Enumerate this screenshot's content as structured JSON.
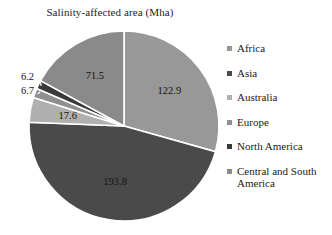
{
  "chart_data": {
    "type": "pie",
    "title": "Salinity-affected area (Mha)",
    "xlabel": "",
    "ylabel": "",
    "legend_position": "right",
    "grid": false,
    "unit": "Mha",
    "total": 418.7,
    "categories": [
      "Africa",
      "Asia",
      "Australia",
      "Europe",
      "North America",
      "Central and South America"
    ],
    "values": [
      122.9,
      193.8,
      17.6,
      6.7,
      6.2,
      71.5
    ],
    "labels": [
      "122.9",
      "193.8",
      "17.6",
      "6.7",
      "6.2",
      "71.5"
    ],
    "colors": [
      "#989898",
      "#4a4a4a",
      "#b0b0b0",
      "#8f8f8f",
      "#3a3a3a",
      "#8a8a8a"
    ],
    "slices": [
      {
        "name": "Africa",
        "value": 122.9,
        "label": "122.9",
        "color": "#989898",
        "label_placement": "inside"
      },
      {
        "name": "Asia",
        "value": 193.8,
        "label": "193.8",
        "color": "#4a4a4a",
        "label_placement": "inside"
      },
      {
        "name": "Australia",
        "value": 17.6,
        "label": "17.6",
        "color": "#b0b0b0",
        "label_placement": "inside"
      },
      {
        "name": "Europe",
        "value": 6.7,
        "label": "6.7",
        "color": "#8f8f8f",
        "label_placement": "callout"
      },
      {
        "name": "North America",
        "value": 6.2,
        "label": "6.2",
        "color": "#3a3a3a",
        "label_placement": "callout"
      },
      {
        "name": "Central and South America",
        "value": 71.5,
        "label": "71.5",
        "color": "#8a8a8a",
        "label_placement": "inside"
      }
    ]
  },
  "legend": {
    "items": [
      {
        "label": "Africa",
        "color": "#989898"
      },
      {
        "label": "Asia",
        "color": "#4a4a4a"
      },
      {
        "label": "Australia",
        "color": "#b0b0b0"
      },
      {
        "label": "Europe",
        "color": "#8f8f8f"
      },
      {
        "label": "North America",
        "color": "#3a3a3a"
      },
      {
        "label": "Central and South America",
        "color": "#8a8a8a"
      }
    ]
  }
}
